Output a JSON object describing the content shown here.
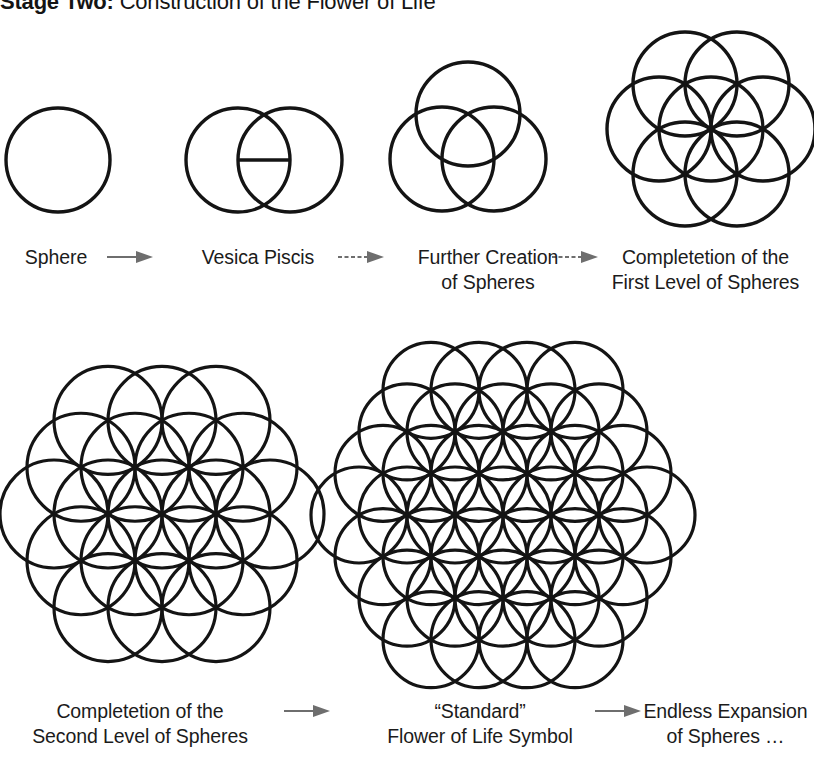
{
  "title": {
    "strong": "Stage Two:",
    "rest": " Construction of the Flower of Life"
  },
  "colors": {
    "ink": "#141414",
    "arrow": "#6e6e6e",
    "background": "#ffffff"
  },
  "rows": [
    {
      "id": "row-1",
      "steps": [
        {
          "key": "sphere",
          "caption_line1": "Sphere",
          "caption_line2": "",
          "figure": "single-circle",
          "circle_count": 1
        },
        {
          "key": "vesica-piscis",
          "caption_line1": "Vesica Piscis",
          "caption_line2": "",
          "figure": "vesica-piscis",
          "circle_count": 2
        },
        {
          "key": "further-creation",
          "caption_line1": "Further Creation",
          "caption_line2": "of Spheres",
          "figure": "three-circles",
          "circle_count": 3
        },
        {
          "key": "first-level",
          "caption_line1": "Completetion of the",
          "caption_line2": "First Level of Spheres",
          "figure": "seed-of-life",
          "circle_count": 7
        }
      ],
      "arrows": [
        {
          "key": "arrow-1",
          "style": "solid"
        },
        {
          "key": "arrow-2",
          "style": "dashed"
        },
        {
          "key": "arrow-3",
          "style": "dashed"
        }
      ]
    },
    {
      "id": "row-2",
      "steps": [
        {
          "key": "second-level",
          "caption_line1": "Completetion of the",
          "caption_line2": "Second Level of Spheres",
          "figure": "nineteen-circles",
          "circle_count": 19
        },
        {
          "key": "standard-flower",
          "caption_line1": "“Standard”",
          "caption_line2": "Flower of Life Symbol",
          "figure": "flower-of-life",
          "circle_count": 37
        },
        {
          "key": "endless-expansion",
          "caption_line1": "Endless Expansion",
          "caption_line2": "of Spheres …",
          "figure": "none",
          "circle_count": 0
        }
      ],
      "arrows": [
        {
          "key": "arrow-4",
          "style": "solid"
        },
        {
          "key": "arrow-5",
          "style": "solid"
        }
      ]
    }
  ]
}
